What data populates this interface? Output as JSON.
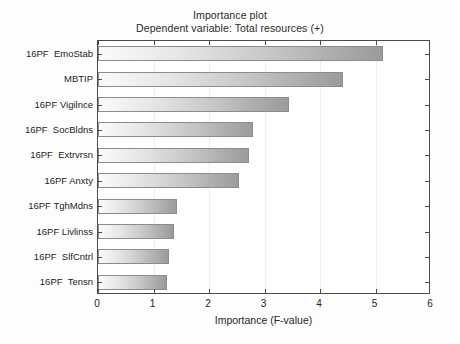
{
  "chart": {
    "title_main": "Importance plot",
    "title_sub": "Dependent variable: Total resources (+)",
    "xlabel": "Importance (F-value)",
    "ylabel": ""
  },
  "chart_data": {
    "type": "bar",
    "orientation": "horizontal",
    "title": "Importance plot",
    "subtitle": "Dependent variable: Total resources (+)",
    "xlabel": "Importance (F-value)",
    "ylabel": "",
    "xlim": [
      0,
      6
    ],
    "xticks": [
      "0",
      "1",
      "2",
      "3",
      "4",
      "5",
      "6"
    ],
    "grid": true,
    "legend": false,
    "categories": [
      "16PF  EmoStab",
      "MBTIP",
      "16PF Vigilnce",
      "16PF  SocBldns",
      "16PF  Extrvrsn",
      "16PF Anxty",
      "16PF TghMdns",
      "16PF Livlinss",
      "16PF  SlfCntrl",
      "16PF  Tensn"
    ],
    "values": [
      5.13,
      4.41,
      3.44,
      2.79,
      2.72,
      2.54,
      1.42,
      1.37,
      1.28,
      1.24
    ],
    "bar_fill": "#d5d5d5",
    "bar_edge": "#8c8c8c",
    "frame_color": "#4a4a4a",
    "grid_color": "#ececec"
  }
}
